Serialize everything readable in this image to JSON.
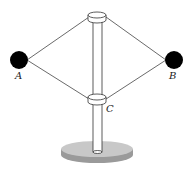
{
  "diagram": {
    "labels": {
      "ball_a": "A",
      "ball_b": "B",
      "collar_c": "C"
    },
    "colors": {
      "ball": "#000000",
      "string": "#444444",
      "pole_fill": "#ffffff",
      "collar_fill": "#ffffff",
      "base_top": "#c8c8c8",
      "base_side": "#9a9a9a",
      "outline": "#333333"
    }
  }
}
